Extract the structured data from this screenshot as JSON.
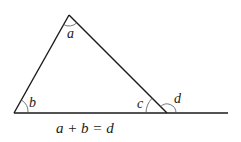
{
  "diagram": {
    "type": "geometry",
    "colors": {
      "stroke": "#1a1a1a",
      "background": "#ffffff"
    },
    "points": {
      "apex": [
        69,
        15
      ],
      "left_base": [
        14,
        113
      ],
      "right_vertex": [
        167,
        113
      ],
      "line_end": [
        228,
        113
      ]
    },
    "angles": [
      {
        "name": "a",
        "label": "a",
        "vertex": "apex"
      },
      {
        "name": "b",
        "label": "b",
        "vertex": "left_base"
      },
      {
        "name": "c",
        "label": "c",
        "vertex": "right_vertex",
        "kind": "interior"
      },
      {
        "name": "d",
        "label": "d",
        "vertex": "right_vertex",
        "kind": "exterior"
      }
    ],
    "equation": "a + b = d"
  }
}
